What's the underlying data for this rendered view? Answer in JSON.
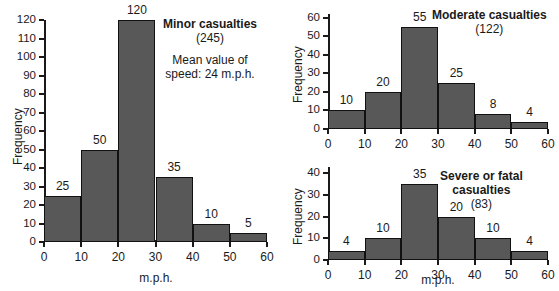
{
  "figure": {
    "background": "#ffffff",
    "bar_fill": "#585858",
    "bar_stroke": "#111111",
    "axis_color": "#1a1a1a"
  },
  "chart_data": [
    {
      "id": "minor",
      "type": "bar",
      "title": "Minor casualties",
      "subtitle": "(245)",
      "note_line1": "Mean value of",
      "note_line2": "speed: 24 m.p.h.",
      "xlabel": "m.p.h.",
      "ylabel": "Frequency",
      "bin_edges": [
        0,
        10,
        20,
        30,
        40,
        50,
        60
      ],
      "categories": [
        "0-10",
        "10-20",
        "20-30",
        "30-40",
        "40-50",
        "50-60"
      ],
      "values": [
        25,
        50,
        120,
        35,
        10,
        5
      ],
      "bar_labels": [
        "25",
        "50",
        "120",
        "35",
        "10",
        "5"
      ],
      "xticks": [
        0,
        10,
        20,
        30,
        40,
        50,
        60
      ],
      "xtick_labels": [
        "0",
        "10",
        "20",
        "30",
        "40",
        "50",
        "60"
      ],
      "yticks": [
        0,
        10,
        20,
        30,
        40,
        50,
        60,
        70,
        80,
        90,
        100,
        110,
        120
      ],
      "ytick_labels": [
        "0",
        "10",
        "20",
        "30",
        "40",
        "50",
        "60",
        "70",
        "80",
        "90",
        "100",
        "110",
        "120"
      ],
      "xlim": [
        0,
        60
      ],
      "ylim": [
        0,
        120
      ],
      "grid": false,
      "legend": "none"
    },
    {
      "id": "moderate",
      "type": "bar",
      "title": "Moderate casualties",
      "subtitle": "(122)",
      "xlabel": "",
      "ylabel": "Frequency",
      "bin_edges": [
        0,
        10,
        20,
        30,
        40,
        50,
        60
      ],
      "categories": [
        "0-10",
        "10-20",
        "20-30",
        "30-40",
        "40-50",
        "50-60"
      ],
      "values": [
        10,
        20,
        55,
        25,
        8,
        4
      ],
      "bar_labels": [
        "10",
        "20",
        "55",
        "25",
        "8",
        "4"
      ],
      "xticks": [
        0,
        10,
        20,
        30,
        40,
        50,
        60
      ],
      "xtick_labels": [
        "0",
        "10",
        "20",
        "30",
        "40",
        "50",
        "60"
      ],
      "yticks": [
        0,
        10,
        20,
        30,
        40,
        50,
        60
      ],
      "ytick_labels": [
        "0",
        "10",
        "20",
        "30",
        "40",
        "50",
        "60"
      ],
      "xlim": [
        0,
        60
      ],
      "ylim": [
        0,
        62
      ],
      "grid": false,
      "legend": "none"
    },
    {
      "id": "severe",
      "type": "bar",
      "title_line1": "Severe or fatal",
      "title_line2": "casualties",
      "subtitle": "(83)",
      "xlabel": "m.p.h.",
      "ylabel": "Frequency",
      "bin_edges": [
        0,
        10,
        20,
        30,
        40,
        50,
        60
      ],
      "categories": [
        "0-10",
        "10-20",
        "20-30",
        "30-40",
        "40-50",
        "50-60"
      ],
      "values": [
        4,
        10,
        35,
        20,
        10,
        4
      ],
      "bar_labels": [
        "4",
        "10",
        "35",
        "20",
        "10",
        "4"
      ],
      "xticks": [
        0,
        10,
        20,
        30,
        40,
        50,
        60
      ],
      "xtick_labels": [
        "0",
        "10",
        "20",
        "30",
        "40",
        "50",
        "60"
      ],
      "yticks": [
        0,
        10,
        20,
        30,
        40
      ],
      "ytick_labels": [
        "0",
        "10",
        "20",
        "30",
        "40"
      ],
      "xlim": [
        0,
        60
      ],
      "ylim": [
        0,
        43
      ],
      "grid": false,
      "legend": "none"
    }
  ]
}
